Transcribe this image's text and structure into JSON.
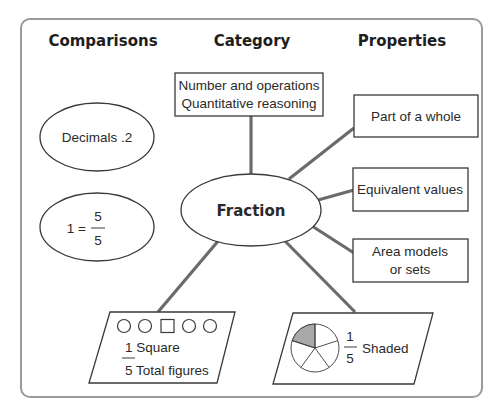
{
  "diagram": {
    "headers": {
      "comparisons": "Comparisons",
      "category": "Category",
      "properties": "Properties"
    },
    "center": {
      "label": "Fraction"
    },
    "category_box": {
      "line1": "Number and operations",
      "line2": "Quantitative reasoning"
    },
    "comparisons": [
      {
        "label": "Decimals .2"
      },
      {
        "prefix": "1 =",
        "numerator": "5",
        "denominator": "5"
      }
    ],
    "properties": [
      {
        "line1": "Part of a whole"
      },
      {
        "line1": "Equivalent values"
      },
      {
        "line1": "Area models",
        "line2": "or sets"
      }
    ],
    "examples": {
      "set_model": {
        "shapes": [
          "circle",
          "circle",
          "square",
          "circle",
          "circle"
        ],
        "numerator_label": "1 Square",
        "denominator_label": "5 Total figures"
      },
      "area_model": {
        "slices": 5,
        "shaded_slices": 1,
        "numerator": "1",
        "denominator": "5",
        "label": "Shaded"
      }
    },
    "colors": {
      "connector": "#6b6b6b",
      "frame": "#9a9a9a",
      "shape_stroke": "#3a3a3a",
      "shaded": "#a8a8a8"
    }
  }
}
